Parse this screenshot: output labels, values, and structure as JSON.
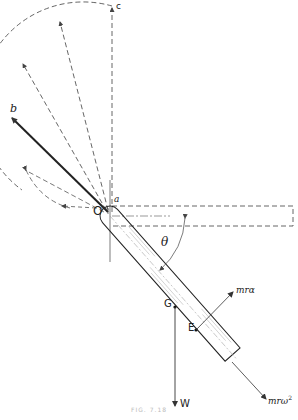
{
  "figure": {
    "caption": "FIG. 7.18",
    "labels": {
      "c": "c",
      "b": "b",
      "a": "a",
      "O": "O",
      "theta": "θ",
      "G": "G",
      "E": "E",
      "W": "W",
      "tangential_force": "mrα",
      "normal_force_base": "mrω",
      "normal_force_exp": "2"
    },
    "colors": {
      "line": "#333333",
      "dashed": "#555555",
      "hatch": "#bbbbbb",
      "background": "#ffffff"
    }
  }
}
